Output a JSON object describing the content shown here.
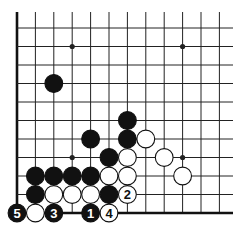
{
  "diagram": {
    "type": "go-board-fragment",
    "grid": {
      "x0": 17,
      "y0": 28,
      "dx": 18.4,
      "dy": 18.5,
      "cols": 12,
      "rows": 11,
      "right_extent": 233,
      "top_extent": 12,
      "left_edge": true,
      "bottom_edge": true
    },
    "colors": {
      "line": "#222222",
      "black": "#111111",
      "white": "#ffffff",
      "edge": "#111111"
    },
    "star_points": [
      [
        3,
        1
      ],
      [
        9,
        1
      ],
      [
        3,
        7
      ],
      [
        9,
        7
      ]
    ],
    "stones": [
      {
        "c": 2,
        "r": 3,
        "color": "black",
        "label": ""
      },
      {
        "c": 6,
        "r": 5,
        "color": "black",
        "label": ""
      },
      {
        "c": 4,
        "r": 6,
        "color": "black",
        "label": ""
      },
      {
        "c": 6,
        "r": 6,
        "color": "black",
        "label": ""
      },
      {
        "c": 7,
        "r": 6,
        "color": "white",
        "label": ""
      },
      {
        "c": 5,
        "r": 7,
        "color": "black",
        "label": ""
      },
      {
        "c": 6,
        "r": 7,
        "color": "white",
        "label": ""
      },
      {
        "c": 8,
        "r": 7,
        "color": "white",
        "label": ""
      },
      {
        "c": 1,
        "r": 8,
        "color": "black",
        "label": ""
      },
      {
        "c": 2,
        "r": 8,
        "color": "black",
        "label": ""
      },
      {
        "c": 3,
        "r": 8,
        "color": "black",
        "label": ""
      },
      {
        "c": 4,
        "r": 8,
        "color": "black",
        "label": ""
      },
      {
        "c": 5,
        "r": 8,
        "color": "white",
        "label": ""
      },
      {
        "c": 6,
        "r": 8,
        "color": "white",
        "label": ""
      },
      {
        "c": 9,
        "r": 8,
        "color": "white",
        "label": ""
      },
      {
        "c": 1,
        "r": 9,
        "color": "black",
        "label": ""
      },
      {
        "c": 2,
        "r": 9,
        "color": "white",
        "label": ""
      },
      {
        "c": 3,
        "r": 9,
        "color": "white",
        "label": ""
      },
      {
        "c": 4,
        "r": 9,
        "color": "white",
        "label": ""
      },
      {
        "c": 5,
        "r": 9,
        "color": "black",
        "label": ""
      },
      {
        "c": 6,
        "r": 9,
        "color": "white",
        "label": "2"
      },
      {
        "c": 0,
        "r": 10,
        "color": "black",
        "label": "5"
      },
      {
        "c": 1,
        "r": 10,
        "color": "white",
        "label": ""
      },
      {
        "c": 2,
        "r": 10,
        "color": "black",
        "label": "3"
      },
      {
        "c": 4,
        "r": 10,
        "color": "black",
        "label": "1"
      },
      {
        "c": 5,
        "r": 10,
        "color": "white",
        "label": "4"
      }
    ]
  }
}
